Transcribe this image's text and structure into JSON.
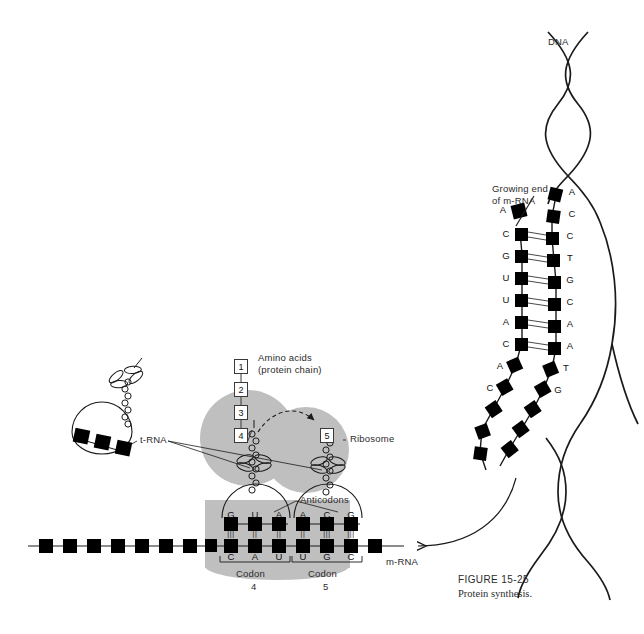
{
  "figure": {
    "number": "FIGURE 15-25",
    "caption": "Protein synthesis."
  },
  "labels": {
    "dna": "DNA",
    "growing_end_line1": "Growing end",
    "growing_end_line2": "of m-RNA",
    "amino_acids_line1": "Amino acids",
    "amino_acids_line2": "(protein chain)",
    "ribosome": "Ribosome",
    "anticodons": "Anticodons",
    "trna": "t-RNA",
    "mrna": "m-RNA",
    "codon_word": "Codon",
    "codon_4_number": "4",
    "codon_5_number": "5"
  },
  "amino_acid_chain": [
    "1",
    "2",
    "3",
    "4",
    "5"
  ],
  "ribosome_site": {
    "anticodon_left": [
      "G",
      "U",
      "A"
    ],
    "anticodon_right": [
      "A",
      "C",
      "G"
    ],
    "codon_left": [
      "C",
      "A",
      "U"
    ],
    "codon_right": [
      "U",
      "G",
      "C"
    ],
    "hbond_left": [
      "|||",
      "||",
      "||"
    ],
    "hbond_right": [
      "||",
      "|||",
      "|||"
    ]
  },
  "transcription": {
    "mrna_free_base": "A",
    "mrna_bases": [
      "A",
      "C",
      "G",
      "U",
      "U",
      "A",
      "C",
      "A",
      "C"
    ],
    "dna_template_bases": [
      "A",
      "C",
      "C",
      "T",
      "G",
      "C",
      "A",
      "A",
      "T",
      "G",
      "T",
      "G"
    ]
  },
  "colors": {
    "ribosome_fill": "#bfbfbf",
    "nucleotide_fill": "#000000",
    "stroke": "#1a1a1a",
    "text": "#2b2b2b",
    "page_bg": "#ffffff"
  }
}
